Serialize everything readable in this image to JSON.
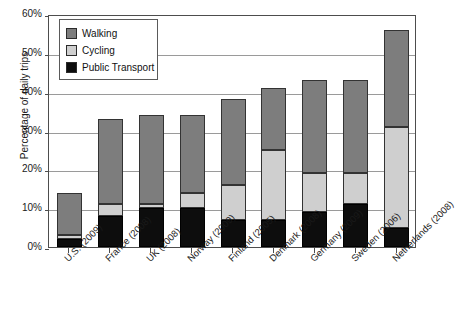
{
  "chart_data": {
    "type": "bar",
    "subtype": "stacked-bar",
    "title": "",
    "xlabel": "",
    "ylabel": "Percentage of daily trips",
    "ylim": [
      0,
      60
    ],
    "ytick_labels": [
      "0%",
      "10%",
      "20%",
      "30%",
      "40%",
      "50%",
      "60%"
    ],
    "ytick_values": [
      0,
      10,
      20,
      30,
      40,
      50,
      60
    ],
    "grid": true,
    "legend_position": "upper-left-inside",
    "categories": [
      "U.S. (2009)",
      "France (2008)",
      "UK (2008)",
      "Norway (2009)",
      "Finland (2005)",
      "Denmark (2008)",
      "Germany (2009)",
      "Sweden (2006)",
      "Netherlands (2008)"
    ],
    "series": [
      {
        "name": "Public Transport",
        "color": "#0d0d0d",
        "values": [
          2,
          8,
          10,
          10,
          7,
          7,
          9,
          11,
          5
        ]
      },
      {
        "name": "Cycling",
        "color": "#cfcfcf",
        "values": [
          1,
          3,
          1,
          4,
          9,
          18,
          10,
          8,
          26
        ]
      },
      {
        "name": "Walking",
        "color": "#7d7d7d",
        "values": [
          11,
          22,
          23,
          20,
          22,
          16,
          24,
          24,
          25
        ]
      }
    ],
    "totals": [
      14,
      33,
      34,
      34,
      38,
      41,
      43,
      43,
      56
    ]
  },
  "legend": {
    "items": [
      {
        "label": "Walking",
        "swatch": "#7d7d7d"
      },
      {
        "label": "Cycling",
        "swatch": "#cfcfcf"
      },
      {
        "label": "Public Transport",
        "swatch": "#0d0d0d"
      }
    ]
  }
}
